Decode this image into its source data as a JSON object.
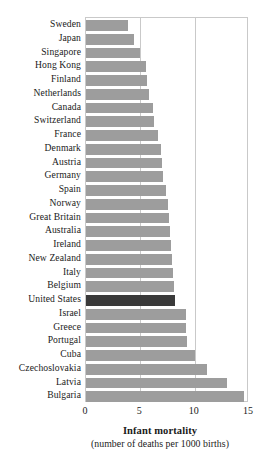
{
  "chart_data": {
    "type": "bar",
    "orientation": "horizontal",
    "title": "",
    "xlabel": "Infant mortality",
    "xlabel_sub": "(number of deaths per 1000 births)",
    "ylabel": "",
    "xlim": [
      0,
      15
    ],
    "xticks": [
      0,
      5,
      10,
      15
    ],
    "xtick_labels": [
      "0",
      "5",
      "10",
      "15"
    ],
    "grid": true,
    "grid_axis": "x",
    "legend": "none",
    "bar_color": "#9d9d9d",
    "highlight_color": "#3a3a3a",
    "highlight_category": "United States",
    "frame_color": "#c9c9c9",
    "categories": [
      "Sweden",
      "Japan",
      "Singapore",
      "Hong Kong",
      "Finland",
      "Netherlands",
      "Canada",
      "Switzerland",
      "France",
      "Denmark",
      "Austria",
      "Germany",
      "Spain",
      "Norway",
      "Great Britain",
      "Australia",
      "Ireland",
      "New Zealand",
      "Italy",
      "Belgium",
      "United States",
      "Israel",
      "Greece",
      "Portugal",
      "Cuba",
      "Czechoslovakia",
      "Latvia",
      "Bulgaria"
    ],
    "values": [
      3.9,
      4.4,
      5.0,
      5.5,
      5.6,
      5.8,
      6.2,
      6.3,
      6.6,
      6.9,
      7.0,
      7.1,
      7.4,
      7.5,
      7.6,
      7.7,
      7.8,
      7.9,
      8.0,
      8.1,
      8.2,
      9.2,
      9.2,
      9.3,
      10.0,
      11.1,
      13.0,
      14.5
    ]
  }
}
